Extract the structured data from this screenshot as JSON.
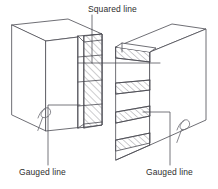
{
  "figure": {
    "type": "technical-line-drawing",
    "view": "isometric",
    "background_color": "#ffffff",
    "line_color": "#4a4a52",
    "hatch_color": "#6b6b73",
    "text_color": "#2e2e2e",
    "stroke_width": 0.8
  },
  "labels": {
    "squared_line": "Squared line",
    "gauged_line_left": "Gauged line",
    "gauged_line_right": "Gauged line"
  },
  "parts": {
    "left_board": {
      "name": "left-board",
      "description": "Board shown on the left with hatched end grain and cut pins"
    },
    "right_board": {
      "name": "right-board",
      "description": "Board shown on the right with hatched sockets along the joint edge"
    }
  },
  "annotations": {
    "pencil_mark_left": "pencil-squiggle-mark",
    "pencil_mark_right": "pencil-squiggle-mark",
    "leader_squared": "vertical-leader-to-joint",
    "leader_gauged_left": "elbow-leader-to-board-face",
    "leader_gauged_right": "elbow-leader-to-board-face"
  }
}
